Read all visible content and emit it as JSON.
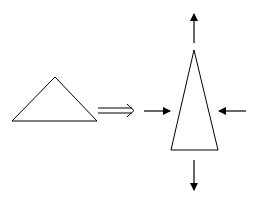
{
  "diagram": {
    "stroke_color": "#000000",
    "background_color": "#ffffff",
    "elements": [
      {
        "id": "initial-triangle",
        "kind": "shape",
        "description": "wide obtuse triangle (initial state)"
      },
      {
        "id": "implies-arrow",
        "kind": "double-arrow",
        "description": "transformation arrow (⟹)"
      },
      {
        "id": "deformed-triangle",
        "kind": "shape",
        "description": "tall narrow isosceles triangle (deformed state)"
      },
      {
        "id": "arrow-up",
        "kind": "force-arrow",
        "direction": "up",
        "description": "elongation"
      },
      {
        "id": "arrow-down",
        "kind": "force-arrow",
        "direction": "down",
        "description": "elongation"
      },
      {
        "id": "arrow-left-in",
        "kind": "force-arrow",
        "direction": "right",
        "description": "compression from left"
      },
      {
        "id": "arrow-right-in",
        "kind": "force-arrow",
        "direction": "left",
        "description": "compression from right"
      }
    ]
  }
}
